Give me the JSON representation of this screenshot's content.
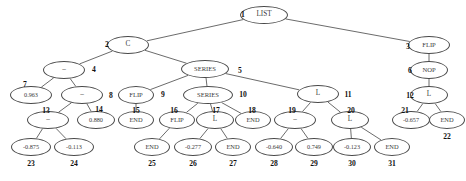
{
  "figure": {
    "kind": "expression-tree-diagram",
    "node_count": 31,
    "background_color": "#ffffff",
    "node_outline_color": "#4a4a4a",
    "edge_color": "#5a5a5a",
    "index_color": "#111111"
  },
  "nodes": [
    {
      "id": 1,
      "label": "LIST",
      "index": "1",
      "cx": 264,
      "cy": 15,
      "rx": 24,
      "ry": 9,
      "fs": 7.2,
      "ix": 237,
      "iy": 11,
      "iw": 12,
      "ifs": 7.6
    },
    {
      "id": 2,
      "label": "C",
      "index": "2",
      "cx": 128,
      "cy": 45,
      "rx": 21,
      "ry": 9,
      "fs": 7.2,
      "ix": 101,
      "iy": 41,
      "iw": 12,
      "ifs": 7.6
    },
    {
      "id": 3,
      "label": "FLIP",
      "index": "3",
      "cx": 429,
      "cy": 45,
      "rx": 21,
      "ry": 9,
      "fs": 6.6,
      "ix": 402,
      "iy": 43,
      "iw": 12,
      "ifs": 7.6
    },
    {
      "id": 4,
      "label": "–",
      "index": "4",
      "cx": 64,
      "cy": 70,
      "rx": 21,
      "ry": 9,
      "fs": 7.2,
      "ix": 88,
      "iy": 66,
      "iw": 12,
      "ifs": 7.6
    },
    {
      "id": 5,
      "label": "SERIES",
      "index": "5",
      "cx": 205,
      "cy": 69,
      "rx": 24,
      "ry": 9,
      "fs": 6.6,
      "ix": 234,
      "iy": 67,
      "iw": 12,
      "ifs": 7.6
    },
    {
      "id": 6,
      "label": "NOP",
      "index": "6",
      "cx": 429,
      "cy": 70,
      "rx": 19,
      "ry": 9,
      "fs": 6.6,
      "ix": 404,
      "iy": 67,
      "iw": 12,
      "ifs": 7.6
    },
    {
      "id": 7,
      "label": "0.963",
      "index": "7",
      "cx": 31,
      "cy": 95,
      "rx": 21,
      "ry": 9,
      "fs": 6.2,
      "ix": 19,
      "iy": 81,
      "iw": 12,
      "ifs": 7.6
    },
    {
      "id": 8,
      "label": "–",
      "index": "8",
      "cx": 82,
      "cy": 95,
      "rx": 21,
      "ry": 9,
      "fs": 7.2,
      "ix": 105,
      "iy": 92,
      "iw": 12,
      "ifs": 7.6
    },
    {
      "id": 9,
      "label": "FLIP",
      "index": "9",
      "cx": 136,
      "cy": 95,
      "rx": 18,
      "ry": 9,
      "fs": 6.6,
      "ix": 157,
      "iy": 91,
      "iw": 12,
      "ifs": 7.6
    },
    {
      "id": 10,
      "label": "SERIES",
      "index": "10",
      "cx": 208,
      "cy": 95,
      "rx": 25,
      "ry": 9,
      "fs": 6.6,
      "ix": 236,
      "iy": 91,
      "iw": 14,
      "ifs": 7.6
    },
    {
      "id": 11,
      "label": "L",
      "index": "11",
      "cx": 318,
      "cy": 94,
      "rx": 21,
      "ry": 9,
      "fs": 7.2,
      "ix": 341,
      "iy": 91,
      "iw": 14,
      "ifs": 7.6
    },
    {
      "id": 12,
      "label": "L",
      "index": "12",
      "cx": 429,
      "cy": 95,
      "rx": 19,
      "ry": 9,
      "fs": 7.2,
      "ix": 403,
      "iy": 92,
      "iw": 14,
      "ifs": 7.6
    },
    {
      "id": 13,
      "label": "–",
      "index": "13",
      "cx": 48,
      "cy": 120,
      "rx": 21,
      "ry": 9,
      "fs": 7.2,
      "ix": 39,
      "iy": 107,
      "iw": 14,
      "ifs": 7.6
    },
    {
      "id": 14,
      "label": "0.880",
      "index": "14",
      "cx": 96,
      "cy": 120,
      "rx": 19,
      "ry": 9,
      "fs": 6.2,
      "ix": 92,
      "iy": 106,
      "iw": 14,
      "ifs": 7.6
    },
    {
      "id": 15,
      "label": "END",
      "index": "15",
      "cx": 136,
      "cy": 120,
      "rx": 18,
      "ry": 9,
      "fs": 6.4,
      "ix": 129,
      "iy": 107,
      "iw": 14,
      "ifs": 7.6
    },
    {
      "id": 16,
      "label": "FLIP",
      "index": "16",
      "cx": 177,
      "cy": 120,
      "rx": 18,
      "ry": 9,
      "fs": 6.6,
      "ix": 167,
      "iy": 107,
      "iw": 14,
      "ifs": 7.6
    },
    {
      "id": 17,
      "label": "L",
      "index": "17",
      "cx": 215,
      "cy": 120,
      "rx": 19,
      "ry": 9,
      "fs": 7.2,
      "ix": 209,
      "iy": 107,
      "iw": 14,
      "ifs": 7.6
    },
    {
      "id": 18,
      "label": "END",
      "index": "18",
      "cx": 253,
      "cy": 120,
      "rx": 18,
      "ry": 9,
      "fs": 6.4,
      "ix": 245,
      "iy": 107,
      "iw": 14,
      "ifs": 7.6
    },
    {
      "id": 19,
      "label": "–",
      "index": "19",
      "cx": 295,
      "cy": 120,
      "rx": 21,
      "ry": 9,
      "fs": 7.2,
      "ix": 285,
      "iy": 107,
      "iw": 14,
      "ifs": 7.6
    },
    {
      "id": 20,
      "label": "L",
      "index": "20",
      "cx": 350,
      "cy": 120,
      "rx": 19,
      "ry": 9,
      "fs": 7.2,
      "ix": 344,
      "iy": 107,
      "iw": 14,
      "ifs": 7.6
    },
    {
      "id": 21,
      "label": "-0.657",
      "index": "21",
      "cx": 411,
      "cy": 120,
      "rx": 19,
      "ry": 9,
      "fs": 6.2,
      "ix": 398,
      "iy": 107,
      "iw": 14,
      "ifs": 7.6
    },
    {
      "id": 22,
      "label": "END",
      "index": "22",
      "cx": 447,
      "cy": 120,
      "rx": 18,
      "ry": 9,
      "fs": 6.4,
      "ix": 440,
      "iy": 133,
      "iw": 14,
      "ifs": 7.6
    },
    {
      "id": 23,
      "label": "-0.875",
      "index": "23",
      "cx": 31,
      "cy": 147,
      "rx": 20,
      "ry": 9,
      "fs": 6.2,
      "ix": 24,
      "iy": 160,
      "iw": 14,
      "ifs": 7.6
    },
    {
      "id": 24,
      "label": "-0.113",
      "index": "24",
      "cx": 74,
      "cy": 147,
      "rx": 20,
      "ry": 9,
      "fs": 6.2,
      "ix": 67,
      "iy": 160,
      "iw": 14,
      "ifs": 7.6
    },
    {
      "id": 25,
      "label": "END",
      "index": "25",
      "cx": 152,
      "cy": 147,
      "rx": 18,
      "ry": 9,
      "fs": 6.4,
      "ix": 145,
      "iy": 160,
      "iw": 14,
      "ifs": 7.6
    },
    {
      "id": 26,
      "label": "-0.277",
      "index": "26",
      "cx": 193,
      "cy": 147,
      "rx": 19,
      "ry": 9,
      "fs": 6.2,
      "ix": 186,
      "iy": 160,
      "iw": 14,
      "ifs": 7.6
    },
    {
      "id": 27,
      "label": "END",
      "index": "27",
      "cx": 233,
      "cy": 147,
      "rx": 18,
      "ry": 9,
      "fs": 6.4,
      "ix": 226,
      "iy": 160,
      "iw": 14,
      "ifs": 7.6
    },
    {
      "id": 28,
      "label": "-0.640",
      "index": "28",
      "cx": 274,
      "cy": 147,
      "rx": 19,
      "ry": 9,
      "fs": 6.2,
      "ix": 267,
      "iy": 160,
      "iw": 14,
      "ifs": 7.6
    },
    {
      "id": 29,
      "label": "0.749",
      "index": "29",
      "cx": 314,
      "cy": 147,
      "rx": 19,
      "ry": 9,
      "fs": 6.2,
      "ix": 307,
      "iy": 160,
      "iw": 14,
      "ifs": 7.6
    },
    {
      "id": 30,
      "label": "-0.123",
      "index": "30",
      "cx": 352,
      "cy": 147,
      "rx": 19,
      "ry": 9,
      "fs": 6.2,
      "ix": 345,
      "iy": 160,
      "iw": 14,
      "ifs": 7.6
    },
    {
      "id": 31,
      "label": "END",
      "index": "31",
      "cx": 392,
      "cy": 147,
      "rx": 18,
      "ry": 9,
      "fs": 6.4,
      "ix": 385,
      "iy": 160,
      "iw": 14,
      "ifs": 7.6
    }
  ],
  "edges": [
    {
      "from": 1,
      "to": 2
    },
    {
      "from": 1,
      "to": 3
    },
    {
      "from": 2,
      "to": 4
    },
    {
      "from": 2,
      "to": 5
    },
    {
      "from": 3,
      "to": 6
    },
    {
      "from": 6,
      "to": 12
    },
    {
      "from": 12,
      "to": 21
    },
    {
      "from": 12,
      "to": 22
    },
    {
      "from": 4,
      "to": 7
    },
    {
      "from": 4,
      "to": 8
    },
    {
      "from": 8,
      "to": 13
    },
    {
      "from": 8,
      "to": 14
    },
    {
      "from": 13,
      "to": 23
    },
    {
      "from": 13,
      "to": 24
    },
    {
      "from": 5,
      "to": 9
    },
    {
      "from": 5,
      "to": 10
    },
    {
      "from": 5,
      "to": 11
    },
    {
      "from": 9,
      "to": 15
    },
    {
      "from": 10,
      "to": 16
    },
    {
      "from": 10,
      "to": 17
    },
    {
      "from": 10,
      "to": 18
    },
    {
      "from": 16,
      "to": 25
    },
    {
      "from": 17,
      "to": 26
    },
    {
      "from": 17,
      "to": 27
    },
    {
      "from": 11,
      "to": 19
    },
    {
      "from": 11,
      "to": 20
    },
    {
      "from": 19,
      "to": 28
    },
    {
      "from": 19,
      "to": 29
    },
    {
      "from": 20,
      "to": 30
    },
    {
      "from": 20,
      "to": 31
    }
  ]
}
